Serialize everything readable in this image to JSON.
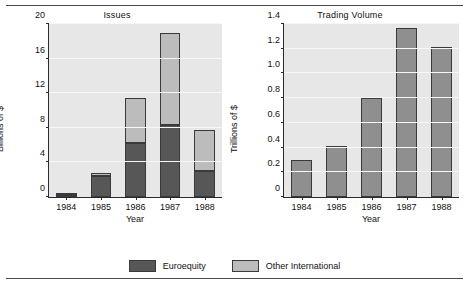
{
  "figure": {
    "background": "#ffffff",
    "panel_background": "#e7e7e7",
    "colors": {
      "euroequity": "#575757",
      "other_international": "#bcbcbc",
      "axis": "#2a2a2a",
      "gridline": "#f7f7f7"
    }
  },
  "legend": {
    "items": [
      {
        "label": "Euroequity",
        "swatch": "dark",
        "color": "#575757"
      },
      {
        "label": "Other International",
        "swatch": "light",
        "color": "#bcbcbc"
      }
    ]
  },
  "chart_data": [
    {
      "type": "bar",
      "stacked": true,
      "title": "Issues",
      "xlabel": "Year",
      "ylabel": "Billions of $",
      "categories": [
        "1984",
        "1985",
        "1986",
        "1987",
        "1988"
      ],
      "ylim": [
        0,
        20
      ],
      "yticks": [
        0,
        4,
        8,
        12,
        16,
        20
      ],
      "ytick_labels": [
        "0",
        "4",
        "8",
        "12",
        "16",
        "20"
      ],
      "grid": true,
      "legend_position": "bottom-center",
      "series": [
        {
          "name": "Euroequity",
          "color": "#575757",
          "values": [
            0.25,
            2.4,
            6.3,
            8.3,
            3.0
          ]
        },
        {
          "name": "Other International",
          "color": "#bcbcbc",
          "values": [
            0.15,
            0.4,
            5.1,
            10.7,
            4.8
          ]
        }
      ],
      "totals": [
        0.4,
        2.8,
        11.4,
        19.0,
        7.8
      ]
    },
    {
      "type": "bar",
      "stacked": false,
      "title": "Trading Volume",
      "xlabel": "Year",
      "ylabel": "Trillions of $",
      "categories": [
        "1984",
        "1985",
        "1986",
        "1987",
        "1988"
      ],
      "ylim": [
        0,
        1.4
      ],
      "yticks": [
        0,
        0.2,
        0.4,
        0.6,
        0.8,
        1.0,
        1.2,
        1.4
      ],
      "ytick_labels": [
        "0",
        "0.2",
        "0.4",
        "0.6",
        "0.8",
        "1.0",
        "1.2",
        "1.4"
      ],
      "grid": true,
      "legend_position": "none",
      "series": [
        {
          "name": "Trading Volume",
          "color": "#8f8f8f",
          "values": [
            0.3,
            0.41,
            0.8,
            1.37,
            1.21
          ]
        }
      ]
    }
  ]
}
